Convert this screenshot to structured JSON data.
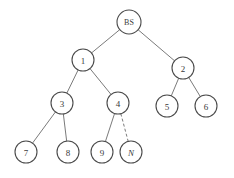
{
  "diagram": {
    "type": "tree",
    "title": "",
    "background_color": "#ffffff",
    "node_stroke_color": "#4a4a4a",
    "node_fill_color": "#ffffff",
    "edge_color": "#6b6b6b",
    "label_color": "#3a3a3a",
    "nodes": [
      {
        "id": "BS",
        "label": "BS",
        "cx": 129,
        "cy": 22,
        "r": 12,
        "font_style": "normal",
        "level": 0
      },
      {
        "id": "1",
        "label": "1",
        "cx": 83,
        "cy": 60,
        "r": 11,
        "font_style": "normal",
        "level": 1
      },
      {
        "id": "2",
        "label": "2",
        "cx": 183,
        "cy": 68,
        "r": 11,
        "font_style": "normal",
        "level": 1
      },
      {
        "id": "3",
        "label": "3",
        "cx": 62,
        "cy": 103,
        "r": 11,
        "font_style": "normal",
        "level": 2
      },
      {
        "id": "4",
        "label": "4",
        "cx": 118,
        "cy": 103,
        "r": 11,
        "font_style": "normal",
        "level": 2
      },
      {
        "id": "5",
        "label": "5",
        "cx": 167,
        "cy": 106,
        "r": 11,
        "font_style": "normal",
        "level": 2
      },
      {
        "id": "6",
        "label": "6",
        "cx": 206,
        "cy": 106,
        "r": 11,
        "font_style": "normal",
        "level": 2
      },
      {
        "id": "7",
        "label": "7",
        "cx": 26,
        "cy": 152,
        "r": 11,
        "font_style": "normal",
        "level": 3
      },
      {
        "id": "8",
        "label": "8",
        "cx": 68,
        "cy": 152,
        "r": 11,
        "font_style": "normal",
        "level": 3
      },
      {
        "id": "9",
        "label": "9",
        "cx": 102,
        "cy": 152,
        "r": 11,
        "font_style": "normal",
        "level": 3
      },
      {
        "id": "N",
        "label": "N",
        "cx": 131,
        "cy": 152,
        "r": 11,
        "font_style": "italic",
        "level": 3
      }
    ],
    "edges": [
      {
        "from": "BS",
        "to": "1",
        "style": "solid"
      },
      {
        "from": "BS",
        "to": "2",
        "style": "solid"
      },
      {
        "from": "1",
        "to": "3",
        "style": "solid"
      },
      {
        "from": "1",
        "to": "4",
        "style": "solid"
      },
      {
        "from": "2",
        "to": "5",
        "style": "solid"
      },
      {
        "from": "2",
        "to": "6",
        "style": "solid"
      },
      {
        "from": "3",
        "to": "7",
        "style": "solid"
      },
      {
        "from": "3",
        "to": "8",
        "style": "solid"
      },
      {
        "from": "4",
        "to": "9",
        "style": "solid"
      },
      {
        "from": "4",
        "to": "N",
        "style": "dashed"
      }
    ]
  }
}
